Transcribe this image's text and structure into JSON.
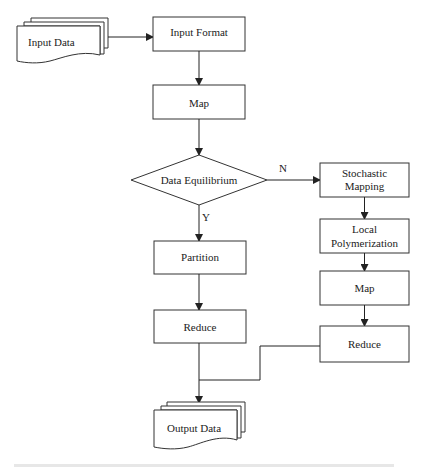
{
  "diagram": {
    "type": "flowchart",
    "nodes": {
      "input_data": {
        "label": "Input Data",
        "shape": "multi-document"
      },
      "input_format": {
        "label": "Input Format",
        "shape": "process"
      },
      "map": {
        "label": "Map",
        "shape": "process"
      },
      "data_equilibrium": {
        "label": "Data Equilibrium",
        "shape": "decision"
      },
      "stochastic_mapping": {
        "label_line1": "Stochastic",
        "label_line2": "Mapping",
        "shape": "process"
      },
      "local_polymerization": {
        "label_line1": "Local",
        "label_line2": "Polymerization",
        "shape": "process"
      },
      "map_right": {
        "label": "Map",
        "shape": "process"
      },
      "reduce_right": {
        "label": "Reduce",
        "shape": "process"
      },
      "partition": {
        "label": "Partition",
        "shape": "process"
      },
      "reduce_left": {
        "label": "Reduce",
        "shape": "process"
      },
      "output_data": {
        "label": "Output Data",
        "shape": "multi-document"
      }
    },
    "edges": [
      {
        "from": "input_data",
        "to": "input_format",
        "label": ""
      },
      {
        "from": "input_format",
        "to": "map",
        "label": ""
      },
      {
        "from": "map",
        "to": "data_equilibrium",
        "label": ""
      },
      {
        "from": "data_equilibrium",
        "to": "stochastic_mapping",
        "label": "N"
      },
      {
        "from": "data_equilibrium",
        "to": "partition",
        "label": "Y"
      },
      {
        "from": "stochastic_mapping",
        "to": "local_polymerization",
        "label": ""
      },
      {
        "from": "local_polymerization",
        "to": "map_right",
        "label": ""
      },
      {
        "from": "map_right",
        "to": "reduce_right",
        "label": ""
      },
      {
        "from": "partition",
        "to": "reduce_left",
        "label": ""
      },
      {
        "from": "reduce_left",
        "to": "output_data",
        "label": ""
      },
      {
        "from": "reduce_right",
        "to": "output_data",
        "label": ""
      }
    ],
    "edge_labels": {
      "no": "N",
      "yes": "Y"
    },
    "colors": {
      "stroke": "#333333",
      "text": "#222222",
      "background": "#ffffff"
    }
  }
}
